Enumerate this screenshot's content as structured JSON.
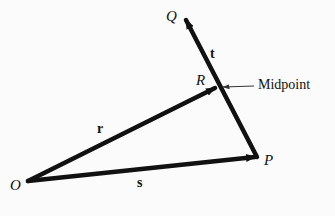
{
  "figure": {
    "points": {
      "O": "O",
      "P": "P",
      "Q": "Q",
      "R": "R"
    },
    "vectors": {
      "r": "r",
      "s": "s",
      "t": "t"
    },
    "annotation": "Midpoint",
    "colors": {
      "ink": "#111111",
      "background": "#fbfbfb"
    }
  }
}
